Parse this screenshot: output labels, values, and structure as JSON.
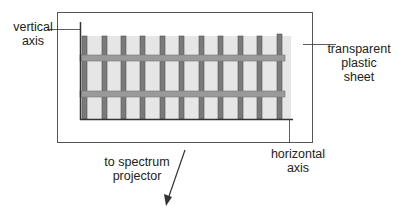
{
  "labels": {
    "vertical_axis": [
      "vertical",
      "axis"
    ],
    "transparent_sheet": [
      "transparent",
      "plastic",
      "sheet"
    ],
    "horizontal_axis": [
      "horizontal",
      "axis"
    ],
    "projector": [
      "to spectrum",
      "projector"
    ]
  },
  "colors": {
    "sheet_border": "#555555",
    "bar_dark": "#7a7a7a",
    "bar_fill_light": "#e6e6e6",
    "strip": "#9a9a9a",
    "axis_line": "#333333"
  },
  "geometry": {
    "sheet": {
      "x": 57,
      "y": 12,
      "w": 255,
      "h": 130
    },
    "grid": {
      "x": 81,
      "y": 36,
      "w": 210,
      "h": 83
    },
    "vertical_bar_count": 11,
    "horizontal_strips_y": [
      55,
      92
    ]
  }
}
